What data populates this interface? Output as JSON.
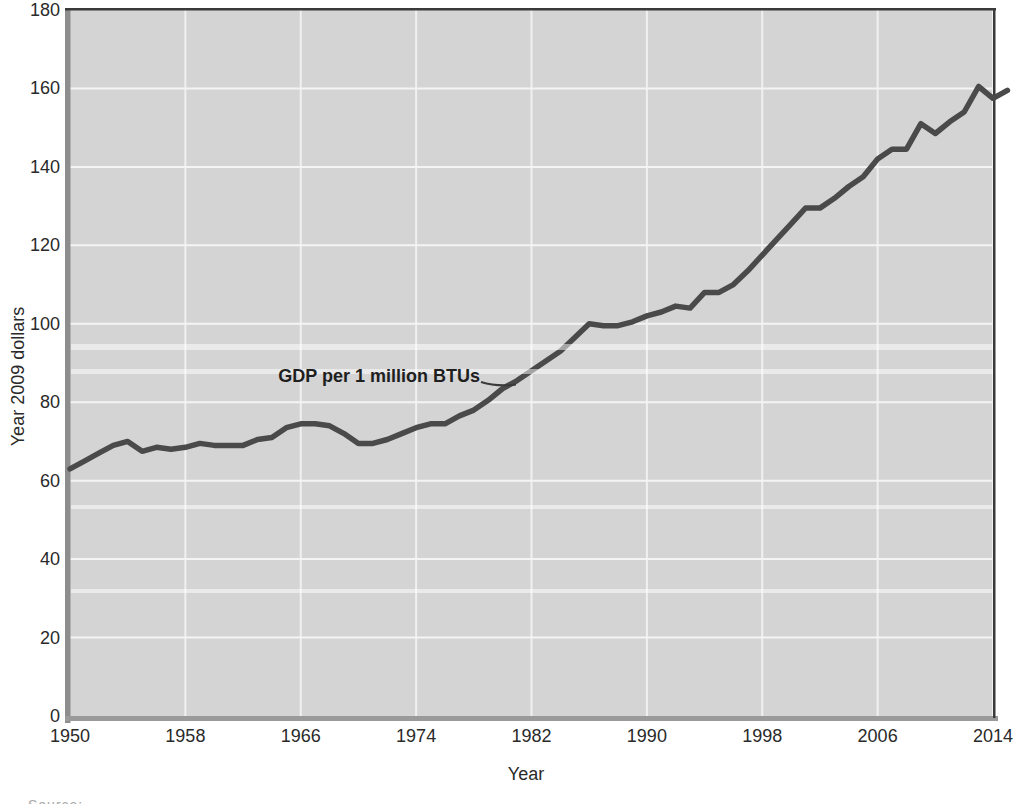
{
  "figure": {
    "y_axis_title": "Year 2009 dollars",
    "x_axis_title": "Year",
    "annotation_label": "GDP per 1 million BTUs",
    "footer_partial_text": "Source:"
  },
  "chart_data": {
    "type": "line",
    "title": "",
    "xlabel": "Year",
    "ylabel": "Year 2009 dollars",
    "xlim": [
      1950,
      2014
    ],
    "ylim": [
      0,
      180
    ],
    "grid": true,
    "x_ticks": [
      1950,
      1958,
      1966,
      1974,
      1982,
      1990,
      1998,
      2006,
      2014
    ],
    "y_ticks": [
      0,
      20,
      40,
      60,
      80,
      100,
      120,
      140,
      160,
      180
    ],
    "annotation": {
      "text": "GDP per 1 million BTUs",
      "points_to_year": 1981,
      "points_to_value": 84
    },
    "series": [
      {
        "name": "GDP per 1 million BTUs",
        "x": [
          1950,
          1951,
          1952,
          1953,
          1954,
          1955,
          1956,
          1957,
          1958,
          1959,
          1960,
          1961,
          1962,
          1963,
          1964,
          1965,
          1966,
          1967,
          1968,
          1969,
          1970,
          1971,
          1972,
          1973,
          1974,
          1975,
          1976,
          1977,
          1978,
          1979,
          1980,
          1981,
          1982,
          1983,
          1984,
          1985,
          1986,
          1987,
          1988,
          1989,
          1990,
          1991,
          1992,
          1993,
          1994,
          1995,
          1996,
          1997,
          1998,
          1999,
          2000,
          2001,
          2002,
          2003,
          2004,
          2005,
          2006,
          2007,
          2008,
          2009,
          2010,
          2011,
          2012,
          2013,
          2014,
          2015
        ],
        "values": [
          63,
          65,
          67,
          69,
          70,
          67.5,
          68.5,
          68,
          68.5,
          69.5,
          69,
          69,
          69,
          70.5,
          71,
          73.5,
          74.5,
          74.5,
          74,
          72,
          69.5,
          69.5,
          70.5,
          72,
          73.5,
          74.5,
          74.5,
          76.5,
          78,
          80.5,
          83.5,
          85.5,
          88,
          90.5,
          93,
          96.5,
          100,
          99.5,
          99.5,
          100.5,
          102,
          103,
          104.5,
          104,
          108,
          108,
          110,
          113.5,
          117.5,
          121.5,
          125.5,
          129.5,
          129.5,
          132,
          135,
          137.5,
          142,
          144.5,
          144.5,
          151,
          148.5,
          151.5,
          154,
          160.5,
          157.5,
          159.5
        ]
      }
    ],
    "colors": {
      "plot_background": "#d4d4d4",
      "gridline": "#f4f4f4",
      "line": "#4a4a4a",
      "axis_band": "#8d8d8d",
      "frame_dark": "#3a3a3a",
      "label_text": "#2a2a2a"
    },
    "legend": "none"
  }
}
